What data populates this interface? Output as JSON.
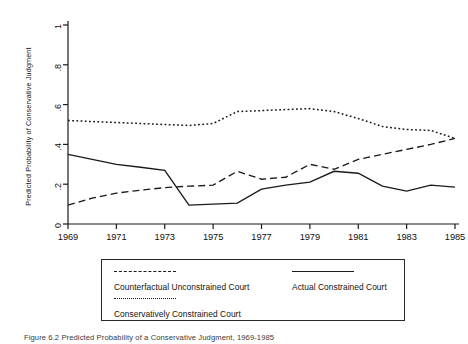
{
  "figure": {
    "caption": "Figure 6.2 Predicted Probability of a Conservative Judgment, 1969-1985"
  },
  "chart_data": {
    "type": "line",
    "title": "",
    "xlabel": "",
    "ylabel": "Predicted Probability of Conservative Judgment",
    "xlim": [
      1969,
      1985
    ],
    "ylim": [
      0,
      1
    ],
    "grid": false,
    "legend_position": "below-plot",
    "x_ticks": [
      "1969",
      "1971",
      "1973",
      "1975",
      "1977",
      "1979",
      "1981",
      "1983",
      "1985"
    ],
    "y_ticks": [
      "0",
      ".2",
      ".4",
      ".6",
      ".8",
      "1"
    ],
    "x": [
      1969,
      1970,
      1971,
      1972,
      1973,
      1974,
      1975,
      1976,
      1977,
      1978,
      1979,
      1980,
      1981,
      1982,
      1983,
      1984,
      1985
    ],
    "series": [
      {
        "name": "Counterfactual Unconstrained Court",
        "style": "dashed",
        "color": "#1a1a1a",
        "values": [
          0.095,
          0.13,
          0.155,
          0.17,
          0.183,
          0.19,
          0.195,
          0.265,
          0.225,
          0.235,
          0.3,
          0.275,
          0.325,
          0.35,
          0.375,
          0.4,
          0.43
        ]
      },
      {
        "name": "Actual Constrained Court",
        "style": "solid",
        "color": "#1a1a1a",
        "values": [
          0.35,
          0.325,
          0.3,
          0.285,
          0.27,
          0.095,
          0.1,
          0.105,
          0.175,
          0.195,
          0.21,
          0.265,
          0.255,
          0.19,
          0.165,
          0.195,
          0.185
        ]
      },
      {
        "name": "Conservatively Constrained Court",
        "style": "dotted",
        "color": "#1a1a1a",
        "values": [
          0.52,
          0.515,
          0.51,
          0.505,
          0.5,
          0.495,
          0.505,
          0.565,
          0.57,
          0.575,
          0.58,
          0.565,
          0.53,
          0.49,
          0.475,
          0.47,
          0.43
        ]
      }
    ]
  },
  "legend": {
    "entries": [
      {
        "label": "Counterfactual Unconstrained Court",
        "style": "dashed"
      },
      {
        "label": "Actual Constrained Court",
        "style": "solid"
      },
      {
        "label": "Conservatively Constrained Court",
        "style": "dotted"
      }
    ]
  }
}
